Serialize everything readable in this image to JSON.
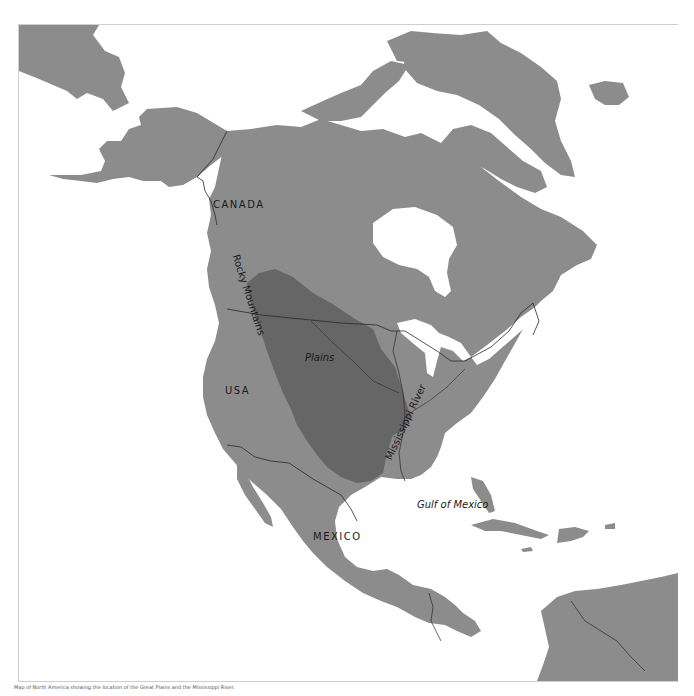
{
  "map": {
    "colors": {
      "water": "#ffffff",
      "land": "#8c8c8c",
      "plains_region": "#666666",
      "borders": "#2a2a2a",
      "label_text": "#1a1a1a"
    },
    "labels": {
      "canada": "CANADA",
      "usa": "USA",
      "mexico": "MEXICO",
      "plains": "Plains",
      "rocky_mountains": "Rocky Mountains",
      "mississippi_river": "Mississippi River",
      "gulf_of_mexico": "Gulf of Mexico"
    },
    "highlighted_region": "Plains"
  },
  "caption": "Map of North America showing the location of the Great Plains and the Mississippi River."
}
